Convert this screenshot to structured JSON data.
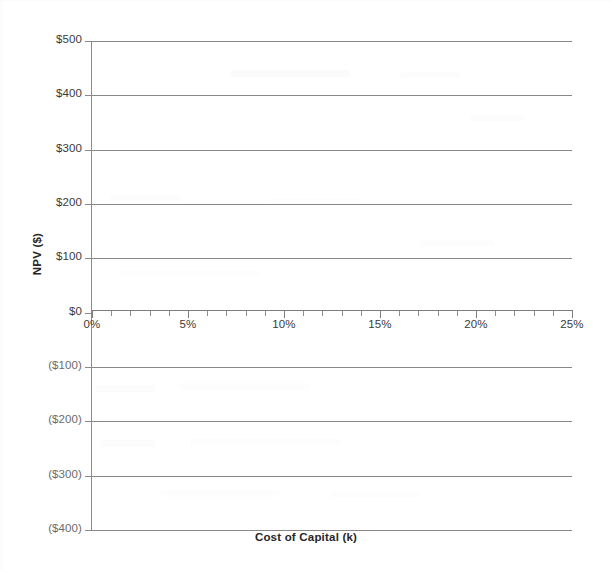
{
  "chart_data": {
    "type": "line",
    "title": "",
    "subtitle": "",
    "xlabel": "Cost of Capital (k)",
    "ylabel": "NPV ($)",
    "xlim": [
      0,
      25
    ],
    "ylim": [
      -400,
      500
    ],
    "grid": true,
    "legend": null,
    "series": [],
    "annotations": [],
    "note": "Blank NPV profile grid template; no data series are plotted.",
    "y_ticks": [
      {
        "value": 500,
        "label": "$500"
      },
      {
        "value": 400,
        "label": "$400"
      },
      {
        "value": 300,
        "label": "$300"
      },
      {
        "value": 200,
        "label": "$200"
      },
      {
        "value": 100,
        "label": "$100"
      },
      {
        "value": 0,
        "label": "$0"
      },
      {
        "value": -100,
        "label": "($100)"
      },
      {
        "value": -200,
        "label": "($200)"
      },
      {
        "value": -300,
        "label": "($300)"
      },
      {
        "value": -400,
        "label": "($400)"
      }
    ],
    "x_ticks": [
      {
        "value": 0,
        "label": "0%"
      },
      {
        "value": 5,
        "label": "5%"
      },
      {
        "value": 10,
        "label": "10%"
      },
      {
        "value": 15,
        "label": "15%"
      },
      {
        "value": 20,
        "label": "20%"
      },
      {
        "value": 25,
        "label": "25%"
      }
    ],
    "x_minor_tick_interval": 1,
    "y_major_tick_interval": 100,
    "colors": {
      "gridline": "#888888",
      "axis": "#7d7d7d",
      "tick_label": "#3a3a3a",
      "negative_tick_label": "#6b6b6b",
      "axis_title": "#262626",
      "background": "#ffffff"
    }
  }
}
